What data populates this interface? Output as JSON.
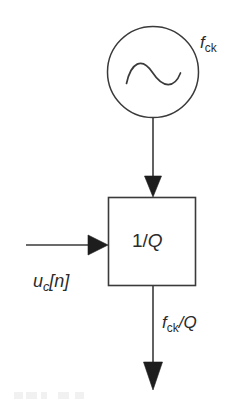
{
  "figure": {
    "kind": "block-diagram",
    "background_color": "#ffffff",
    "line_color": "#333333",
    "text_color": "#2b2b2b"
  },
  "nodes": {
    "oscillator": {
      "icon": "sine-wave-oscillator-icon",
      "shape": "circle",
      "cx": 153,
      "cy": 72,
      "r": 46,
      "label": "f",
      "label_sub": "ck",
      "label_x": 200,
      "label_y": 34
    },
    "divider_block": {
      "shape": "rectangle",
      "x": 108,
      "y": 197,
      "width": 88,
      "height": 89,
      "text_numerator": "1/",
      "text_variable": "Q"
    }
  },
  "signals": {
    "clock_in": {
      "name": "clock-input-arrow",
      "from": [
        153,
        118
      ],
      "to": [
        153,
        197
      ],
      "orientation": "vertical-down",
      "arrowhead": "solid-triangle"
    },
    "control_in": {
      "name": "control-input-arrow",
      "from": [
        26,
        245
      ],
      "to": [
        108,
        245
      ],
      "orientation": "horizontal-right",
      "arrowhead": "solid-triangle",
      "label": "u",
      "label_sub": "c",
      "label_tail": "[n]"
    },
    "clock_out": {
      "name": "clock-output-arrow",
      "from": [
        153,
        286
      ],
      "to": [
        153,
        390
      ],
      "orientation": "vertical-down",
      "arrowhead": "solid-triangle",
      "label_num": "f",
      "label_num_sub": "ck",
      "label_den": "/Q"
    }
  }
}
